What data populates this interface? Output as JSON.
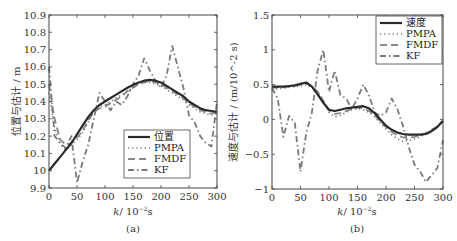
{
  "chart_data": [
    {
      "id": "a",
      "type": "line",
      "caption": "(a)",
      "title": "",
      "xlabel": "k / 10^-2 s",
      "xlabel_main": "k",
      "xlabel_unit": "/ 10",
      "xlabel_exp": "−2",
      "xlabel_tail": "s",
      "ylabel": "位置与估计 / m",
      "xlim": [
        0,
        300
      ],
      "ylim": [
        9.9,
        10.9
      ],
      "xticks": [
        0,
        50,
        100,
        150,
        200,
        250,
        300
      ],
      "yticks": [
        9.9,
        10,
        10.1,
        10.2,
        10.3,
        10.4,
        10.5,
        10.6,
        10.7,
        10.8,
        10.9
      ],
      "ytick_labels": [
        "9.9",
        "10",
        "10.1",
        "10.2",
        "10.3",
        "10.4",
        "10.5",
        "10.6",
        "10.7",
        "10.8",
        "10.9"
      ],
      "grid": false,
      "legend_position": "lower right",
      "legend": [
        "位置",
        "PMPA",
        "FMDF",
        "KF"
      ],
      "x": [
        0,
        10,
        20,
        30,
        40,
        50,
        60,
        70,
        80,
        90,
        100,
        110,
        120,
        130,
        140,
        150,
        160,
        170,
        180,
        190,
        200,
        210,
        220,
        230,
        240,
        250,
        260,
        270,
        280,
        290,
        300
      ],
      "series": [
        {
          "name": "位置",
          "style": "solid",
          "color": "#2a2a2a",
          "width": 2.2,
          "values": [
            10.0,
            10.04,
            10.08,
            10.12,
            10.16,
            10.21,
            10.26,
            10.31,
            10.35,
            10.38,
            10.4,
            10.42,
            10.44,
            10.46,
            10.48,
            10.495,
            10.51,
            10.52,
            10.525,
            10.52,
            10.51,
            10.49,
            10.47,
            10.45,
            10.43,
            10.4,
            10.38,
            10.36,
            10.35,
            10.345,
            10.34
          ]
        },
        {
          "name": "PMPA",
          "style": "dotted",
          "color": "#777777",
          "width": 1.6,
          "values": [
            10.45,
            10.25,
            10.15,
            10.12,
            10.15,
            10.18,
            10.22,
            10.28,
            10.34,
            10.37,
            10.38,
            10.4,
            10.42,
            10.44,
            10.46,
            10.48,
            10.5,
            10.51,
            10.51,
            10.5,
            10.49,
            10.47,
            10.45,
            10.43,
            10.41,
            10.38,
            10.36,
            10.34,
            10.33,
            10.32,
            10.33
          ]
        },
        {
          "name": "FMDF",
          "style": "dashed",
          "color": "#888888",
          "width": 1.8,
          "values": [
            10.5,
            10.3,
            10.18,
            10.15,
            10.16,
            10.19,
            10.23,
            10.29,
            10.34,
            10.36,
            10.37,
            10.39,
            10.41,
            10.43,
            10.46,
            10.48,
            10.5,
            10.51,
            10.52,
            10.51,
            10.5,
            10.48,
            10.46,
            10.44,
            10.42,
            10.39,
            10.37,
            10.35,
            10.34,
            10.33,
            10.34
          ]
        },
        {
          "name": "KF",
          "style": "dashdot",
          "color": "#7a7a7a",
          "width": 1.8,
          "values": [
            10.6,
            10.2,
            10.16,
            10.13,
            10.2,
            9.93,
            10.05,
            10.15,
            10.3,
            10.45,
            10.4,
            10.35,
            10.4,
            10.38,
            10.43,
            10.5,
            10.55,
            10.65,
            10.58,
            10.52,
            10.48,
            10.55,
            10.72,
            10.6,
            10.48,
            10.32,
            10.28,
            10.2,
            10.16,
            10.14,
            10.4
          ]
        }
      ]
    },
    {
      "id": "b",
      "type": "line",
      "caption": "(b)",
      "title": "",
      "xlabel": "k / 10^-2 s",
      "xlabel_main": "k",
      "xlabel_unit": "/ 10",
      "xlabel_exp": "−2",
      "xlabel_tail": "s",
      "ylabel": "速度与估计 / (m/10^-2 s)",
      "xlim": [
        0,
        300
      ],
      "ylim": [
        -1,
        1.5
      ],
      "xticks": [
        0,
        50,
        100,
        150,
        200,
        250,
        300
      ],
      "yticks": [
        -1,
        -0.5,
        0,
        0.5,
        1,
        1.5
      ],
      "ytick_labels": [
        "−1",
        "−0.5",
        "0",
        "0.5",
        "1",
        "1.5"
      ],
      "grid": false,
      "legend_position": "upper right",
      "legend": [
        "速度",
        "PMPA",
        "FMDF",
        "KF"
      ],
      "x": [
        0,
        10,
        20,
        30,
        40,
        50,
        60,
        70,
        80,
        90,
        100,
        110,
        120,
        130,
        140,
        150,
        160,
        170,
        180,
        190,
        200,
        210,
        220,
        230,
        240,
        250,
        260,
        270,
        280,
        290,
        300
      ],
      "series": [
        {
          "name": "速度",
          "style": "solid",
          "color": "#2a2a2a",
          "width": 2.2,
          "values": [
            0.47,
            0.47,
            0.47,
            0.48,
            0.49,
            0.51,
            0.53,
            0.47,
            0.36,
            0.24,
            0.14,
            0.12,
            0.14,
            0.16,
            0.17,
            0.18,
            0.19,
            0.16,
            0.09,
            0.0,
            -0.09,
            -0.15,
            -0.19,
            -0.21,
            -0.22,
            -0.22,
            -0.22,
            -0.21,
            -0.17,
            -0.11,
            -0.02
          ]
        },
        {
          "name": "PMPA",
          "style": "dotted",
          "color": "#777777",
          "width": 1.6,
          "values": [
            0.42,
            0.44,
            0.45,
            0.46,
            0.47,
            0.48,
            0.5,
            0.46,
            0.4,
            0.28,
            0.1,
            0.04,
            0.06,
            0.1,
            0.14,
            0.16,
            0.14,
            0.1,
            0.04,
            -0.05,
            -0.14,
            -0.22,
            -0.28,
            -0.32,
            -0.3,
            -0.28,
            -0.25,
            -0.2,
            -0.15,
            -0.1,
            -0.04
          ]
        },
        {
          "name": "FMDF",
          "style": "dashed",
          "color": "#8a8a8a",
          "width": 1.8,
          "values": [
            0.45,
            0.46,
            0.46,
            0.47,
            0.48,
            0.5,
            0.52,
            0.48,
            0.4,
            0.26,
            0.13,
            0.08,
            0.09,
            0.12,
            0.15,
            0.17,
            0.16,
            0.12,
            0.06,
            -0.03,
            -0.11,
            -0.18,
            -0.23,
            -0.26,
            -0.26,
            -0.25,
            -0.23,
            -0.2,
            -0.15,
            -0.1,
            -0.03
          ]
        },
        {
          "name": "KF",
          "style": "dashdot",
          "color": "#7a7a7a",
          "width": 1.8,
          "values": [
            0.45,
            0.3,
            -0.25,
            0.05,
            -0.05,
            -0.75,
            -0.2,
            0.1,
            0.7,
            1.0,
            0.4,
            0.7,
            0.35,
            0.3,
            0.15,
            0.3,
            0.5,
            0.35,
            0.1,
            0.05,
            0.1,
            0.3,
            0.15,
            -0.1,
            -0.4,
            -0.65,
            -0.75,
            -0.9,
            -0.8,
            -0.7,
            -0.3
          ]
        }
      ]
    }
  ]
}
